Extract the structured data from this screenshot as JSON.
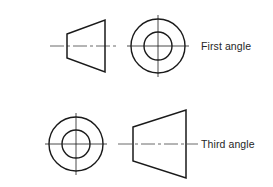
{
  "diagram": {
    "background_color": "#ffffff",
    "line_color": "#1a1a1a",
    "centerline_color": "#6b6b6b",
    "text_color": "#262626",
    "rows": [
      {
        "id": "first-angle",
        "label": "First angle",
        "centerline_y": 46,
        "left_view": {
          "type": "truncated-cone-side-view",
          "shape": "trapezoid",
          "narrow_edge": "left",
          "wide_edge": "right",
          "x_left": 67,
          "x_right": 105,
          "left_half_height": 12,
          "right_half_height": 26
        },
        "right_view": {
          "type": "truncated-cone-end-view",
          "shape": "concentric-circles",
          "center_x": 158,
          "center_y": 46,
          "outer_radius": 27,
          "inner_radius": 14
        }
      },
      {
        "id": "third-angle",
        "label": "Third angle",
        "centerline_y": 144,
        "left_view": {
          "type": "truncated-cone-end-view",
          "shape": "concentric-circles",
          "center_x": 76,
          "center_y": 144,
          "outer_radius": 27,
          "inner_radius": 14
        },
        "right_view": {
          "type": "truncated-cone-side-view",
          "shape": "trapezoid",
          "narrow_edge": "left",
          "wide_edge": "right",
          "x_left": 133,
          "x_right": 186,
          "left_half_height": 17,
          "right_half_height": 34
        }
      }
    ]
  }
}
